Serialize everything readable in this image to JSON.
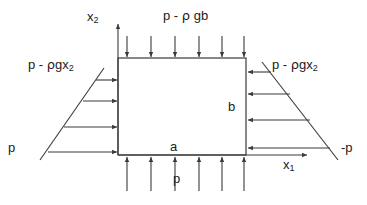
{
  "figure": {
    "type": "free-body-diagram",
    "title_text": ""
  },
  "axes": {
    "vertical": {
      "label": "x",
      "subscript": "2",
      "name": "x2-axis"
    },
    "horizontal": {
      "label": "x",
      "subscript": "1",
      "name": "x1-axis"
    },
    "origin_x": 118,
    "origin_y": 155
  },
  "element": {
    "left": 118,
    "top": 58,
    "right": 246,
    "bottom": 155,
    "width_label": "a",
    "height_label": "b"
  },
  "loads": {
    "top": {
      "label": "p - ",
      "rho": "ρ",
      "label_tail": " gb",
      "full_label": "p - ρ gb",
      "arrow_count": 6,
      "direction": "down"
    },
    "bottom": {
      "label": "p",
      "arrow_count": 6,
      "direction": "up"
    },
    "left": {
      "label_head": "p - ",
      "rho": "ρ",
      "label_tail": "gx",
      "label_sub": "2",
      "full_label": "p - ρgx₂",
      "base_label": "p",
      "arrow_count": 4,
      "direction": "right"
    },
    "right": {
      "label_head": "p - ",
      "rho": "ρ",
      "label_tail": "gx",
      "label_sub": "2",
      "full_label": "p - ρgx₂",
      "base_label": "-p",
      "arrow_count": 4,
      "direction": "left"
    }
  },
  "colors": {
    "stroke": "#3a3a3a",
    "text": "#1c1c1c",
    "background": "#ffffff"
  }
}
